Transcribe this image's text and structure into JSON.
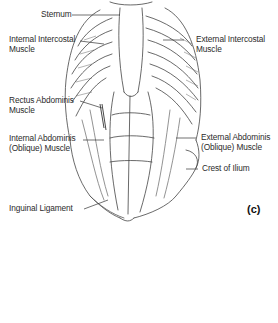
{
  "figure": {
    "panel_letter": "(c)",
    "labels": [
      {
        "id": "sternum",
        "text": "Sternum"
      },
      {
        "id": "internal-intercostal",
        "line1": "Internal Intercostal",
        "line2": "Muscle"
      },
      {
        "id": "external-intercostal",
        "line1": "External Intercostal",
        "line2": "Muscle"
      },
      {
        "id": "rectus-abdominis",
        "line1": "Rectus Abdominis",
        "line2": "Muscle"
      },
      {
        "id": "internal-abdominis",
        "line1": "Internal Abdominis",
        "line2": "(Oblique) Muscle"
      },
      {
        "id": "external-abdominis",
        "line1": "External Abdominis",
        "line2": "(Oblique) Muscle"
      },
      {
        "id": "crest-of-ilium",
        "text": "Crest of Ilium"
      },
      {
        "id": "inguinal-ligament",
        "text": "Inguinal Ligament"
      }
    ],
    "colors": {
      "ink": "#2b2b2b",
      "shade": "#7a7a7a",
      "background": "#ffffff"
    }
  }
}
